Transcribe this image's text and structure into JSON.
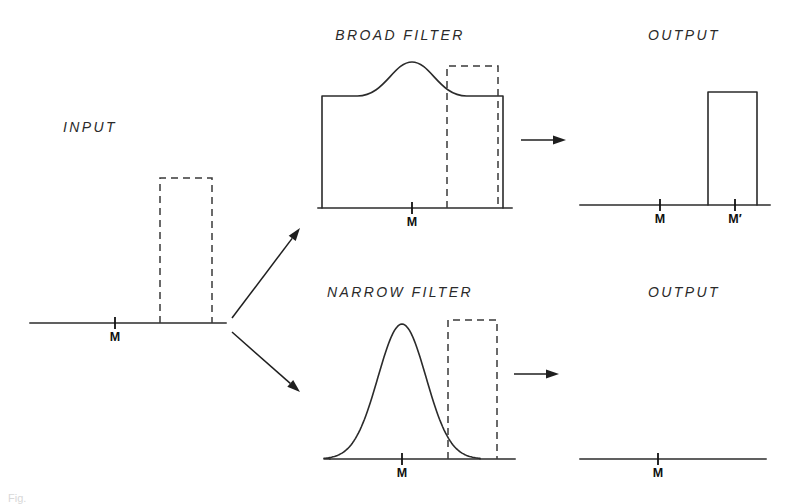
{
  "figure": {
    "panels": {
      "input": {
        "title": "INPUT",
        "title_x": 90,
        "title_y": 132,
        "baseline": {
          "x1": 30,
          "x2": 226,
          "y": 323
        },
        "tick": {
          "x": 115,
          "label": "M",
          "label_x": 115,
          "label_y": 341
        },
        "pulse": {
          "x1": 160,
          "x2": 212,
          "top": 178,
          "style": "dashed"
        }
      },
      "broad_filter": {
        "title": "BROAD  FILTER",
        "title_x": 400,
        "title_y": 40,
        "baseline": {
          "x1": 318,
          "x2": 512,
          "y": 208
        },
        "tick": {
          "x": 412,
          "label": "M",
          "label_x": 412,
          "label_y": 226
        },
        "passband": {
          "left": 322,
          "right": 503,
          "top": 96
        },
        "bump": {
          "center": 412,
          "peak_y": 62,
          "half_width": 26
        },
        "pulse": {
          "x1": 447,
          "x2": 498,
          "top": 66,
          "style": "dashed"
        }
      },
      "narrow_filter": {
        "title": "NARROW  FILTER",
        "title_x": 400,
        "title_y": 297,
        "baseline": {
          "x1": 330,
          "x2": 515,
          "y": 459
        },
        "tick": {
          "x": 402,
          "label": "M",
          "label_x": 402,
          "label_y": 477
        },
        "gaussian": {
          "center": 402,
          "peak_y": 324,
          "half_width": 30
        },
        "pulse": {
          "x1": 448,
          "x2": 497,
          "top": 320,
          "style": "dashed"
        }
      },
      "output_top": {
        "title": "OUTPUT",
        "title_x": 684,
        "title_y": 40,
        "baseline": {
          "x1": 580,
          "x2": 770,
          "y": 205
        },
        "ticks": [
          {
            "x": 660,
            "label": "M",
            "label_x": 660,
            "label_y": 223
          },
          {
            "x": 735,
            "label": "M′",
            "label_x": 735,
            "label_y": 223
          }
        ],
        "pulse": {
          "x1": 708,
          "x2": 757,
          "top": 92,
          "style": "solid"
        }
      },
      "output_bottom": {
        "title": "OUTPUT",
        "title_x": 684,
        "title_y": 297,
        "baseline": {
          "x1": 580,
          "x2": 766,
          "y": 459
        },
        "ticks": [
          {
            "x": 658,
            "label": "M",
            "label_x": 658,
            "label_y": 477
          }
        ],
        "pulse": null
      }
    },
    "arrows": [
      {
        "name": "input-to-broad",
        "x1": 232,
        "y1": 318,
        "x2": 300,
        "y2": 228
      },
      {
        "name": "input-to-narrow",
        "x1": 232,
        "y1": 332,
        "x2": 300,
        "y2": 392
      },
      {
        "name": "broad-to-output",
        "x1": 521,
        "y1": 140,
        "x2": 566,
        "y2": 140
      },
      {
        "name": "narrow-to-output",
        "x1": 514,
        "y1": 374,
        "x2": 559,
        "y2": 374
      }
    ],
    "caption": "Fig.",
    "colors": {
      "ink": "#2b2b2b",
      "background": "#ffffff",
      "dashed": "#3a3a3a"
    }
  }
}
